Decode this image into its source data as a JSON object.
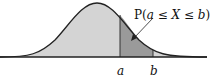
{
  "diagram": {
    "annotation": "P(a ≤ X ≤ b)",
    "annotation_parts": {
      "prefix": "P(",
      "a": "a",
      "le1": " ≤ ",
      "X": "X",
      "le2": " ≤ ",
      "b": "b",
      "suffix": ")"
    },
    "x_labels": {
      "a": "a",
      "b": "b"
    },
    "colors": {
      "curve_fill": "#d4d4d4",
      "region_fill": "#9a9a9a",
      "stroke": "#222222",
      "background": "#ffffff"
    }
  }
}
